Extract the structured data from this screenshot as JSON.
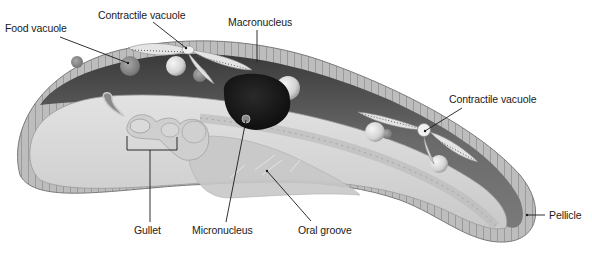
{
  "diagram": {
    "labels": {
      "food_vacuole": "Food vacuole",
      "contractile_vacuole_top": "Contractile vacuole",
      "macronucleus": "Macronucleus",
      "contractile_vacuole_right": "Contractile vacuole",
      "gullet": "Gullet",
      "micronucleus": "Micronucleus",
      "oral_groove": "Oral groove",
      "pellicle": "Pellicle"
    },
    "colors": {
      "background": "#ffffff",
      "pellicle": "#b8b8b8",
      "cytoplasm_dark": "#6e6e6e",
      "cytoplasm_light": "#d8d8d8",
      "macronucleus": "#161616",
      "vacuole": "#e6e6e6",
      "leader_line": "#1a1a1a",
      "text": "#1a1a1a"
    }
  }
}
